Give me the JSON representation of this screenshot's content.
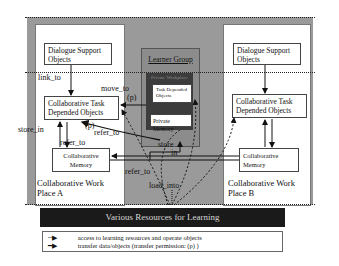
{
  "diagram": {
    "place_a": {
      "title_line1": "Collaborative Work",
      "title_line2": "Place A",
      "dialogue": [
        "Dialogue Support",
        "Objects"
      ],
      "task": [
        "Collaborative Task",
        "Depended Objects"
      ],
      "memory": [
        "Collaborative",
        "Memory"
      ]
    },
    "place_b": {
      "title_line1": "Collaborative Work",
      "title_line2": "Place B",
      "dialogue": [
        "Dialogue Support",
        "Objects"
      ],
      "task": [
        "Collaborative Task",
        "Depended Objects"
      ],
      "memory": [
        "Collaborative",
        "Memory"
      ]
    },
    "learner_group": {
      "title": "Learner Group",
      "private_workplace": "Private Workplace",
      "task": [
        "Task Depended",
        "Objects"
      ],
      "memory": "Private Memory"
    },
    "edge_labels": {
      "link_to": "link_to",
      "move_to": "move_to",
      "move_to_p": "(p)",
      "store_in_left": "store_in",
      "refer_to_p": "(p)",
      "refer_to_1": "refer_to",
      "refer_to_2": "refer_to",
      "refer_to_3": "refer_to",
      "store": "store",
      "in": "in",
      "load_into": "load_into"
    },
    "resources": "Various Resources for Learning",
    "legend": {
      "dotted": "access to learning resources and operate objects",
      "solid": "transfer data/objects (transfer permission:  (p) )"
    }
  }
}
